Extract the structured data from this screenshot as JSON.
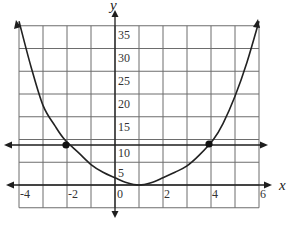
{
  "chart_data": {
    "type": "line",
    "title": "",
    "xlabel": "x",
    "ylabel": "y",
    "xlim": [
      -4,
      6
    ],
    "ylim": [
      -5,
      35
    ],
    "grid": true,
    "x_ticks": [
      -4,
      -2,
      0,
      2,
      4,
      6
    ],
    "x_tick_labels": [
      "-4",
      "-2",
      "0",
      "2",
      "4",
      "6"
    ],
    "y_ticks": [
      0,
      5,
      10,
      15,
      20,
      25,
      30,
      35
    ],
    "y_tick_labels": [
      "0",
      "5",
      "10",
      "15",
      "20",
      "25",
      "30",
      "35"
    ],
    "x_grid_step": 1,
    "y_grid_step": 5,
    "series": [
      {
        "name": "curve",
        "kind": "parabola-like curve with arrows at both ends",
        "x": [
          -4,
          -3.5,
          -3,
          -2.5,
          -2.1,
          -1.5,
          -1,
          -0.5,
          0,
          0.5,
          1,
          1.5,
          2,
          2.5,
          3,
          3.5,
          4.1,
          4.5,
          5,
          5.5,
          6
        ],
        "y": [
          36,
          26,
          17.5,
          13,
          10,
          7,
          4.5,
          2.8,
          1.6,
          0.5,
          0,
          0.5,
          1.6,
          2.8,
          4.2,
          6.5,
          10,
          13.5,
          19.5,
          27,
          36
        ]
      },
      {
        "name": "horizontal line",
        "kind": "line with arrows at both ends",
        "x": [
          -4.2,
          6.1
        ],
        "y": [
          10,
          10
        ]
      }
    ],
    "points": [
      {
        "label": "left intersection",
        "x": -2.1,
        "y": 10
      },
      {
        "label": "right intersection",
        "x": 4.1,
        "y": 10
      }
    ]
  },
  "labels": {
    "x_axis": "x",
    "y_axis": "y",
    "x_ticks": [
      "-4",
      "-2",
      "0",
      "2",
      "4",
      "6"
    ],
    "y_ticks": [
      "35",
      "30",
      "25",
      "20",
      "15",
      "10",
      "5"
    ],
    "origin": "0"
  }
}
